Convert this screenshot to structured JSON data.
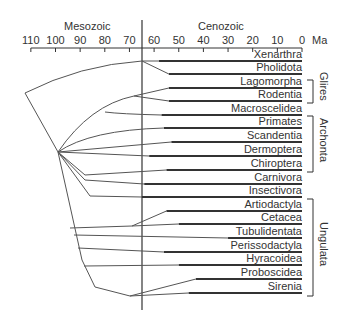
{
  "axis": {
    "unit": "Ma",
    "eras": [
      {
        "label": "Mesozoic",
        "x": 88
      },
      {
        "label": "Cenozoic",
        "x": 220
      }
    ],
    "ticks": [
      {
        "label": "110",
        "value": 110
      },
      {
        "label": "100",
        "value": 100
      },
      {
        "label": "90",
        "value": 90
      },
      {
        "label": "80",
        "value": 80
      },
      {
        "label": "70",
        "value": 70
      },
      {
        "label": "60",
        "value": 60
      },
      {
        "label": "50",
        "value": 50
      },
      {
        "label": "40",
        "value": 40
      },
      {
        "label": "30",
        "value": 30
      },
      {
        "label": "20",
        "value": 20
      },
      {
        "label": "10",
        "value": 10
      },
      {
        "label": "0",
        "value": 0
      }
    ],
    "boundary_ma": 66
  },
  "taxa": [
    {
      "name": "Xenarthra",
      "y": 61,
      "start_ma": 58
    },
    {
      "name": "Pholidota",
      "y": 74,
      "start_ma": 54
    },
    {
      "name": "Lagomorpha",
      "y": 88,
      "start_ma": 54
    },
    {
      "name": "Rodentia",
      "y": 101,
      "start_ma": 54
    },
    {
      "name": "Macroscelidea",
      "y": 115,
      "start_ma": 57
    },
    {
      "name": "Primates",
      "y": 128,
      "start_ma": 56
    },
    {
      "name": "Scandentia",
      "y": 142,
      "start_ma": 53
    },
    {
      "name": "Dermoptera",
      "y": 156,
      "start_ma": 62
    },
    {
      "name": "Chiroptera",
      "y": 170,
      "start_ma": 55
    },
    {
      "name": "Carnivora",
      "y": 184,
      "start_ma": 64
    },
    {
      "name": "Insectivora",
      "y": 197,
      "start_ma": 65
    },
    {
      "name": "Artiodactyla",
      "y": 211,
      "start_ma": 55
    },
    {
      "name": "Cetacea",
      "y": 224,
      "start_ma": 50
    },
    {
      "name": "Tubulidentata",
      "y": 238,
      "start_ma": 30
    },
    {
      "name": "Perissodactyla",
      "y": 252,
      "start_ma": 56
    },
    {
      "name": "Hyracoidea",
      "y": 265,
      "start_ma": 50
    },
    {
      "name": "Proboscidea",
      "y": 279,
      "start_ma": 43
    },
    {
      "name": "Sirenia",
      "y": 293,
      "start_ma": 46
    }
  ],
  "groups": [
    {
      "label": "Glires",
      "y_top": 80,
      "y_bottom": 103
    },
    {
      "label": "Archonta",
      "y_top": 116,
      "y_bottom": 172
    },
    {
      "label": "Ungulata",
      "y_top": 199,
      "y_bottom": 296
    }
  ],
  "colors": {
    "line": "#555555",
    "thick": "#333333",
    "text": "#333333"
  }
}
